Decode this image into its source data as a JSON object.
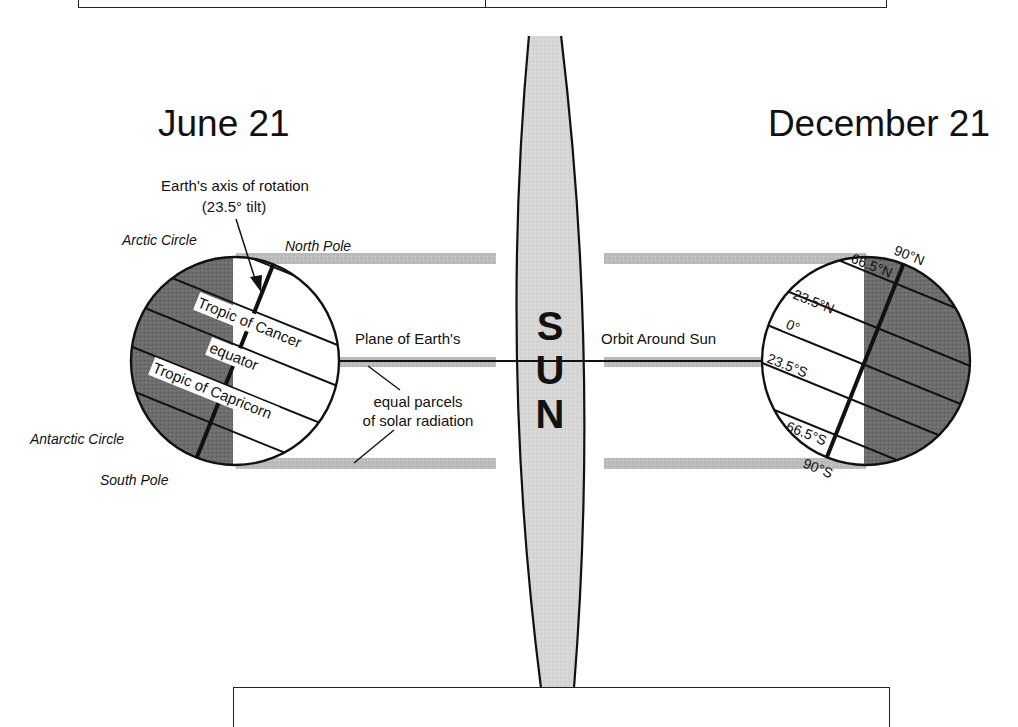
{
  "diagram": {
    "title_box_top": "",
    "caption_box_bottom": "",
    "left_panel": {
      "date_label": "June 21",
      "axis_label_line1": "Earth's axis of rotation",
      "axis_label_line2": "(23.5° tilt)",
      "arctic_circle": "Arctic Circle",
      "north_pole": "North Pole",
      "antarctic_circle": "Antarctic Circle",
      "south_pole": "South Pole",
      "tropic_of_cancer": "Tropic of Cancer",
      "equator": "equator",
      "tropic_of_capricorn": "Tropic of Capricorn"
    },
    "center": {
      "sun_letters": [
        "S",
        "U",
        "N"
      ],
      "plane_label_left": "Plane of Earth's",
      "plane_label_right": "Orbit Around Sun",
      "parcels_line1": "equal parcels",
      "parcels_line2": "of solar radiation"
    },
    "right_panel": {
      "date_label": "December 21",
      "lat_90N": "90°N",
      "lat_66_5N": "66.5°N",
      "lat_23_5N": "23.5°N",
      "lat_0": "0°",
      "lat_23_5S": "23.5°S",
      "lat_66_5S": "66.5°S",
      "lat_90S": "90°S"
    },
    "colors": {
      "night_shade": "#6b6b6b",
      "sun_fill": "#d4d4d4",
      "radiation_band": "#b9b9b9",
      "ink": "#111111"
    }
  }
}
